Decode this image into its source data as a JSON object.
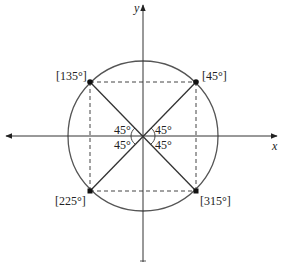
{
  "diagram": {
    "type": "unit-circle-reference-angles",
    "axes": {
      "x_label": "x",
      "y_label": "y"
    },
    "points": [
      {
        "label": "[45°]",
        "angle": 45
      },
      {
        "label": "[135°]",
        "angle": 135
      },
      {
        "label": "[225°]",
        "angle": 225
      },
      {
        "label": "[315°]",
        "angle": 315
      }
    ],
    "reference_angles": [
      {
        "label": "45°",
        "quadrant": "I"
      },
      {
        "label": "45°",
        "quadrant": "II"
      },
      {
        "label": "45°",
        "quadrant": "III"
      },
      {
        "label": "45°",
        "quadrant": "IV"
      }
    ],
    "colors": {
      "stroke": "#333333",
      "circle": "#555555",
      "dashed": "#444444"
    }
  }
}
